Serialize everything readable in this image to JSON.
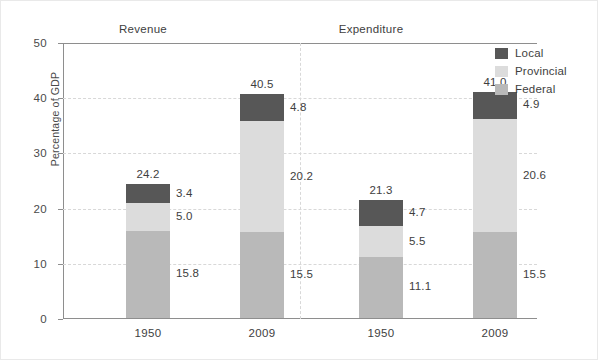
{
  "chart_data": {
    "type": "bar",
    "subtype": "stacked-bar-grouped",
    "title": "",
    "xlabel": "",
    "ylabel": "Percentage of GDP",
    "ylim": [
      0,
      50
    ],
    "yticks": [
      "0",
      "10",
      "20",
      "30",
      "40",
      "50"
    ],
    "grid": "horizontal-dashed",
    "legend_position": "right-top",
    "legend": [
      {
        "name": "Local",
        "color": "#575757"
      },
      {
        "name": "Provincial",
        "color": "#dcdcdc"
      },
      {
        "name": "Federal",
        "color": "#b9b9b9"
      }
    ],
    "panels": [
      {
        "name": "Revenue"
      },
      {
        "name": "Expenditure"
      }
    ],
    "categories": [
      "1950",
      "2009",
      "1950",
      "2009"
    ],
    "series": [
      {
        "name": "Federal",
        "values": [
          15.8,
          15.5,
          11.1,
          15.5
        ]
      },
      {
        "name": "Provincial",
        "values": [
          5.0,
          20.2,
          5.5,
          20.6
        ]
      },
      {
        "name": "Local",
        "values": [
          3.4,
          4.8,
          4.7,
          4.9
        ]
      }
    ],
    "totals": [
      24.2,
      40.5,
      21.3,
      41.0
    ],
    "bars": [
      {
        "panel": "Revenue",
        "category": "1950",
        "total_label": "24.2",
        "total": 24.2,
        "segments": [
          {
            "series": "Local",
            "value": 3.4,
            "label": "3.4"
          },
          {
            "series": "Provincial",
            "value": 5.0,
            "label": "5.0"
          },
          {
            "series": "Federal",
            "value": 15.8,
            "label": "15.8"
          }
        ]
      },
      {
        "panel": "Revenue",
        "category": "2009",
        "total_label": "40.5",
        "total": 40.5,
        "segments": [
          {
            "series": "Local",
            "value": 4.8,
            "label": "4.8"
          },
          {
            "series": "Provincial",
            "value": 20.2,
            "label": "20.2"
          },
          {
            "series": "Federal",
            "value": 15.5,
            "label": "15.5"
          }
        ]
      },
      {
        "panel": "Expenditure",
        "category": "1950",
        "total_label": "21.3",
        "total": 21.3,
        "segments": [
          {
            "series": "Local",
            "value": 4.7,
            "label": "4.7"
          },
          {
            "series": "Provincial",
            "value": 5.5,
            "label": "5.5"
          },
          {
            "series": "Federal",
            "value": 11.1,
            "label": "11.1"
          }
        ]
      },
      {
        "panel": "Expenditure",
        "category": "2009",
        "total_label": "41.0",
        "total": 41.0,
        "segments": [
          {
            "series": "Local",
            "value": 4.9,
            "label": "4.9"
          },
          {
            "series": "Provincial",
            "value": 20.6,
            "label": "20.6"
          },
          {
            "series": "Federal",
            "value": 15.5,
            "label": "15.5"
          }
        ]
      }
    ],
    "colors": {
      "local": "#575757",
      "provincial": "#dcdcdc",
      "federal": "#b9b9b9",
      "axis": "#8e8e8e",
      "grid": "#d8d8d8",
      "text": "#3e3e3e",
      "background": "#ffffff"
    }
  }
}
